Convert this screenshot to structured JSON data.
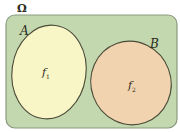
{
  "diagram": {
    "universe_label": "Ω",
    "sets": [
      {
        "label": "A",
        "inner_label": "f",
        "inner_sub": "1",
        "fill": "#f8f5c6"
      },
      {
        "label": "B",
        "inner_label": "f",
        "inner_sub": "2",
        "fill": "#f2d3b0"
      }
    ],
    "colors": {
      "universe_fill": "#c3d8ae",
      "universe_stroke": "#7c8f72",
      "ellipse_stroke": "#4a4a38"
    }
  }
}
